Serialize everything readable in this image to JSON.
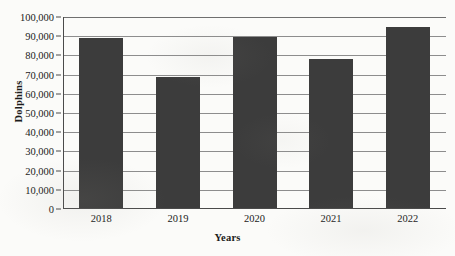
{
  "chart_data": {
    "type": "bar",
    "title": "",
    "xlabel": "Years",
    "ylabel": "Dolphins",
    "categories": [
      "2018",
      "2019",
      "2020",
      "2021",
      "2022"
    ],
    "values": [
      88500,
      68000,
      89000,
      77500,
      94500
    ],
    "ylim": [
      0,
      100000
    ],
    "ytick_labels": [
      "100,000",
      "90,000",
      "80,000",
      "70,000",
      "60,000",
      "50,000",
      "40,000",
      "30,000",
      "20,000",
      "10,000",
      "0"
    ],
    "ytick_values": [
      100000,
      90000,
      80000,
      70000,
      60000,
      50000,
      40000,
      30000,
      20000,
      10000,
      0
    ],
    "grid": true,
    "legend": "none",
    "bar_color": "#3c3c3c",
    "gridline_color": "#8d8d8d",
    "axis_color": "#4a4a4a",
    "background_color": "#fbfbf9"
  }
}
